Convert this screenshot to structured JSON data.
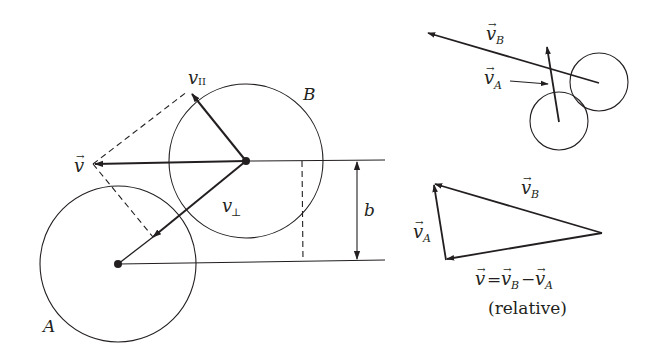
{
  "figure": {
    "colors": {
      "ink": "#231f20",
      "background": "#ffffff"
    }
  },
  "main_diagram": {
    "circle_a": {
      "label": "A",
      "cx": 118,
      "cy": 264,
      "r": 78
    },
    "circle_b": {
      "label": "B",
      "cx": 246,
      "cy": 161,
      "r": 77
    },
    "vectors": {
      "v": {
        "label": "v",
        "arrow_glyph": "→",
        "from": [
          246,
          161
        ],
        "to": [
          93,
          164
        ]
      },
      "v_parallel": {
        "label": "v",
        "subscript": "II",
        "from": [
          246,
          161
        ],
        "to": [
          192,
          93
        ]
      },
      "v_perp": {
        "label": "v",
        "subscript": "⊥",
        "from": [
          246,
          161
        ],
        "to": [
          151,
          239
        ]
      }
    },
    "impact_parameter": {
      "label": "b"
    }
  },
  "top_right_diagram": {
    "circle_a": {
      "cx": 559,
      "cy": 121,
      "r": 29
    },
    "circle_b": {
      "cx": 599,
      "cy": 82,
      "r": 29
    },
    "labels": {
      "v_b": {
        "label": "v",
        "subscript": "B",
        "arrow_glyph": "→"
      },
      "v_a": {
        "label": "v",
        "subscript": "A",
        "arrow_glyph": "→"
      }
    }
  },
  "bottom_right_diagram": {
    "labels": {
      "v_b": {
        "label": "v",
        "subscript": "B",
        "arrow_glyph": "→"
      },
      "v_a": {
        "label": "v",
        "subscript": "A",
        "arrow_glyph": "→"
      }
    },
    "equation": {
      "lhs": "v",
      "equals": "=",
      "term1": "v",
      "term1_sub": "B",
      "minus": "−",
      "term2": "v",
      "term2_sub": "A",
      "arrow_glyph": "→"
    },
    "caption": "(relative)"
  }
}
